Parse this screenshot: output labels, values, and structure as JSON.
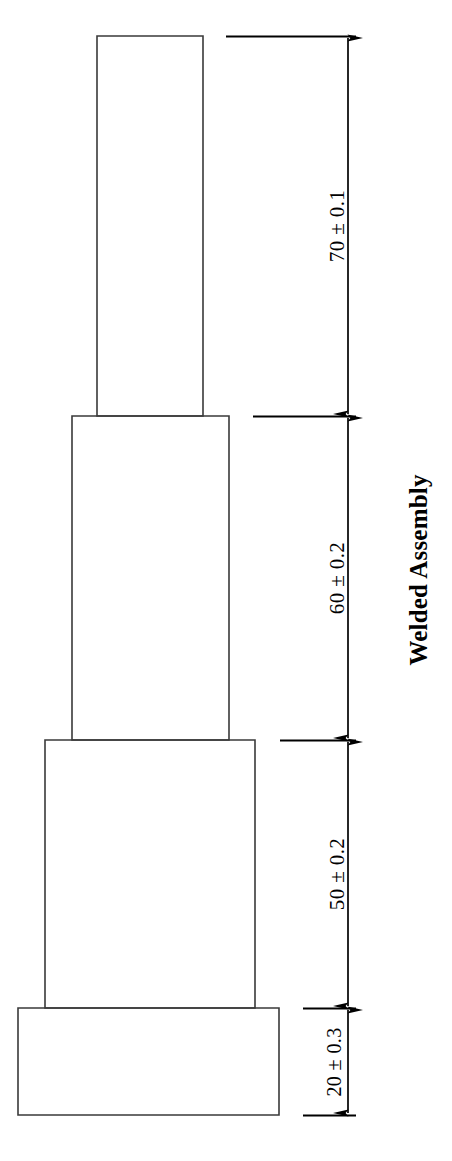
{
  "drawing": {
    "title": "Welded Assembly",
    "background_color": "#ffffff",
    "line_color": "#3a3a3a",
    "dimension_color": "#000000",
    "canvas": {
      "width": 452,
      "height": 1161
    },
    "parts": [
      {
        "name": "top-cylinder",
        "label": "70 ± 0.1",
        "nominal": 70,
        "tolerance": 0.1,
        "x": 97,
        "y": 36,
        "width": 106,
        "height": 380
      },
      {
        "name": "upper-middle-cylinder",
        "label": "60 ± 0.2",
        "nominal": 60,
        "tolerance": 0.2,
        "x": 72,
        "y": 416,
        "width": 157,
        "height": 324
      },
      {
        "name": "lower-middle-cylinder",
        "label": "50 ± 0.2",
        "nominal": 50,
        "tolerance": 0.2,
        "x": 45,
        "y": 740,
        "width": 210,
        "height": 268
      },
      {
        "name": "base-flange",
        "label": "20 ± 0.3",
        "nominal": 20,
        "tolerance": 0.3,
        "x": 18,
        "y": 1008,
        "width": 261,
        "height": 107
      }
    ],
    "dimension_line_x": 348,
    "extension_lines": [
      {
        "name": "ext-line-top",
        "y": 36,
        "x_start": 226,
        "x_end": 356
      },
      {
        "name": "ext-line-70-60",
        "y": 416,
        "x_start": 253,
        "x_end": 356
      },
      {
        "name": "ext-line-60-50",
        "y": 740,
        "x_start": 280,
        "x_end": 356
      },
      {
        "name": "ext-line-50-20",
        "y": 1008,
        "x_start": 303,
        "x_end": 356
      },
      {
        "name": "ext-line-bottom",
        "y": 1115,
        "x_start": 303,
        "x_end": 356
      }
    ],
    "dimensions": [
      {
        "name": "dimension-70",
        "label": "70 ± 0.1",
        "value": 70,
        "tolerance": "± 0.1",
        "y_top": 36,
        "y_bottom": 416,
        "label_x": 337,
        "label_y": 226
      },
      {
        "name": "dimension-60",
        "label": "60 ± 0.2",
        "value": 60,
        "tolerance": "± 0.2",
        "y_top": 416,
        "y_bottom": 740,
        "label_x": 337,
        "label_y": 578
      },
      {
        "name": "dimension-50",
        "label": "50 ± 0.2",
        "value": 50,
        "tolerance": "± 0.2",
        "y_top": 740,
        "y_bottom": 1008,
        "label_x": 337,
        "label_y": 874
      },
      {
        "name": "dimension-20",
        "label": "20 ± 0.3",
        "value": 20,
        "tolerance": "± 0.3",
        "y_top": 1008,
        "y_bottom": 1115,
        "label_x": 334,
        "label_y": 1062
      }
    ],
    "title_position": {
      "x": 418,
      "y": 570
    }
  }
}
